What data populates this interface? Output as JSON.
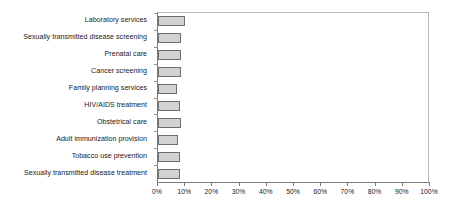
{
  "chart_data": {
    "type": "bar",
    "orientation": "horizontal",
    "title": "",
    "subtitle": "",
    "xlabel": "",
    "ylabel": "",
    "xlim": [
      0,
      100
    ],
    "xtick_labels": [
      "0%",
      "10%",
      "20%",
      "30%",
      "40%",
      "50%",
      "60%",
      "70%",
      "80%",
      "90%",
      "100%"
    ],
    "xticks": [
      0,
      10,
      20,
      30,
      40,
      50,
      60,
      70,
      80,
      90,
      100
    ],
    "grid": false,
    "legend": null,
    "categories": [
      "Laboratory services",
      "Sexually transmitted disease screening",
      "Prenatal care",
      "Cancer screening",
      "Family planning services",
      "HIV/AIDS treatment",
      "Obstetrical care",
      "Adult immunization provision",
      "Tobacco use prevention",
      "Sexually transmitted disease treatment"
    ],
    "values": [
      10,
      8.5,
      8.5,
      8.5,
      7,
      8,
      8.5,
      7.5,
      8,
      8
    ],
    "bar_fill_color": "#d2d2d2",
    "bar_border_color": "#6e6e6e",
    "axis_color": "#7a7a7a",
    "frame_color": "#b9b9b9",
    "text_color": "#1a1a1a"
  }
}
